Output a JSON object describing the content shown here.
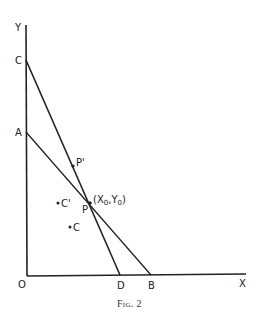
{
  "figure": {
    "caption": "Fig. 2",
    "axes": {
      "x_label": "X",
      "y_label": "Y",
      "origin_label": "O"
    },
    "points": {
      "C": "C",
      "A": "A",
      "D": "D",
      "B": "B",
      "P": "P",
      "P_prime": "P'",
      "C_prime": "C'",
      "c_lower": "C",
      "P_coords_open": "(X",
      "P_coords_sub0": "0",
      "P_coords_mid": ",Y",
      "P_coords_sub1": "0",
      "P_coords_close": ")"
    },
    "lines": [
      {
        "name": "CD",
        "from": "C",
        "to": "D"
      },
      {
        "name": "AB",
        "from": "A",
        "to": "B"
      }
    ],
    "colors": {
      "ink": "#222222",
      "background": "#ffffff"
    }
  }
}
